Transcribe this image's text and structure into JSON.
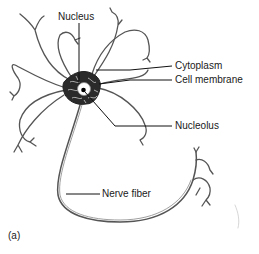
{
  "diagram": {
    "type": "neuron-illustration",
    "panel_label": "(a)",
    "labels": {
      "nucleus": "Nucleus",
      "cytoplasm": "Cytoplasm",
      "cell_membrane": "Cell membrane",
      "nucleolus": "Nucleolus",
      "nerve_fiber": "Nerve fiber"
    },
    "colors": {
      "line": "#333333",
      "background": "#ffffff",
      "cell_body": "#222222"
    }
  }
}
